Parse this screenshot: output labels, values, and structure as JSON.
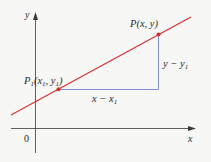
{
  "diagram": {
    "type": "coordinate-geometry",
    "colors": {
      "background": "#f7f7f6",
      "axes": "#3a3a3a",
      "line": "#d6312f",
      "triangle": "#8190d3",
      "points": "#d6312f",
      "text": "#2b2b2b"
    },
    "axes": {
      "x_label": "x",
      "y_label": "y",
      "origin_label": "0"
    },
    "points": {
      "p1": {
        "label_main": "P",
        "label_sub": "1",
        "coords_text": "(x",
        "coords_sub1": "1",
        "coords_mid": ", y",
        "coords_sub2": "1",
        "coords_end": ")"
      },
      "p": {
        "label": "P(x, y)"
      }
    },
    "segments": {
      "horizontal_label_main": "x − x",
      "horizontal_label_sub": "1",
      "vertical_label_main": "y − y",
      "vertical_label_sub": "1"
    }
  }
}
